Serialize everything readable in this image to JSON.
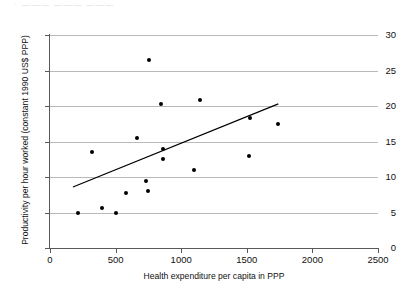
{
  "figure": {
    "top_fragment": "·  ———  ——— ———",
    "background_color": "#ffffff"
  },
  "chart_data": {
    "type": "scatter",
    "title": "",
    "xlabel": "Health expenditure per capita in PPP",
    "ylabel": "Productivity per hour worked (constant 1990 US$ PPP)",
    "xlim": [
      0,
      2500
    ],
    "ylim": [
      0,
      30
    ],
    "xticks": [
      0,
      500,
      1000,
      1500,
      2000,
      2500
    ],
    "yticks": [
      0,
      5,
      10,
      15,
      20,
      25,
      30
    ],
    "xtick_labels": [
      "0",
      "500",
      "1000",
      "1500",
      "2000",
      "2500"
    ],
    "ytick_labels": [
      "0",
      "5",
      "10",
      "15",
      "20",
      "25",
      "30"
    ],
    "grid": "horizontal",
    "legend": "none",
    "marker_color": "#000000",
    "gridline_color": "#b9b9b9",
    "axis_color": "#5a5a5a",
    "points": [
      {
        "x": 210,
        "y": 5.0
      },
      {
        "x": 320,
        "y": 13.55
      },
      {
        "x": 395,
        "y": 5.65
      },
      {
        "x": 500,
        "y": 5.0
      },
      {
        "x": 580,
        "y": 7.7
      },
      {
        "x": 665,
        "y": 15.55
      },
      {
        "x": 735,
        "y": 9.4
      },
      {
        "x": 750,
        "y": 8.0
      },
      {
        "x": 755,
        "y": 26.5
      },
      {
        "x": 845,
        "y": 20.25
      },
      {
        "x": 860,
        "y": 14.0
      },
      {
        "x": 865,
        "y": 12.6
      },
      {
        "x": 1100,
        "y": 11.0
      },
      {
        "x": 1140,
        "y": 20.8
      },
      {
        "x": 1515,
        "y": 12.9
      },
      {
        "x": 1525,
        "y": 18.25
      },
      {
        "x": 1735,
        "y": 17.5
      }
    ],
    "trendline": {
      "type": "linear",
      "x_start": 175,
      "y_start": 8.6,
      "x_end": 1740,
      "y_end": 20.3,
      "color": "#000000"
    }
  }
}
